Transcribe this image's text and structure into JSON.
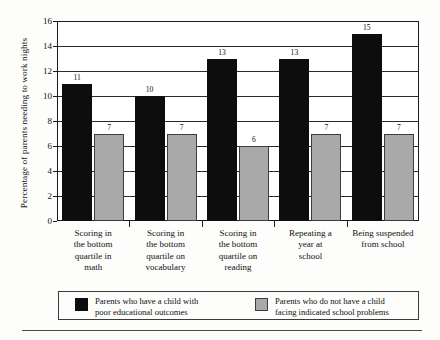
{
  "chart_data": {
    "type": "bar",
    "title": "",
    "xlabel": "",
    "ylabel": "Percentage of parents needing to work nights",
    "ylim": [
      0,
      16
    ],
    "yticks": [
      0,
      2,
      4,
      6,
      8,
      10,
      12,
      14,
      16
    ],
    "grid": true,
    "legend_position": "bottom",
    "categories": [
      "Scoring in\nthe bottom\nquartile in\nmath",
      "Scoring in\nthe bottom\nquartile on\nvocabulary",
      "Scoring in\nthe bottom\nquartile on\nreading",
      "Repeating a\nyear at\nschool",
      "Being suspended\nfrom school"
    ],
    "series": [
      {
        "name": "Parents who have a child with\npoor educational outcomes",
        "color": "#0d0d0d",
        "values": [
          11,
          10,
          13,
          13,
          15
        ]
      },
      {
        "name": "Parents who do not have a child\nfacing indicated school problems",
        "color": "#a9a9a9",
        "values": [
          7,
          7,
          6,
          7,
          7
        ]
      }
    ]
  },
  "legend": {
    "entries": [
      "Parents who have a child with\npoor educational outcomes",
      "Parents who do not have a child\nfacing indicated school problems"
    ]
  }
}
